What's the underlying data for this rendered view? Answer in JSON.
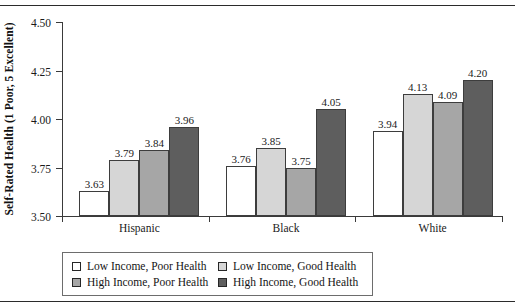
{
  "chart_data": {
    "type": "bar",
    "title": "",
    "xlabel": "",
    "ylabel": "Self-Rated Health (1 Poor, 5 Excellent)",
    "ylim": [
      3.5,
      4.5
    ],
    "yticks": [
      "3.50",
      "3.75",
      "4.00",
      "4.25",
      "4.50"
    ],
    "ytick_values": [
      3.5,
      3.75,
      4.0,
      4.25,
      4.5
    ],
    "grid": false,
    "legend_position": "bottom-left",
    "categories": [
      "Hispanic",
      "Black",
      "White"
    ],
    "series": [
      {
        "name": "Low Income, Poor Health",
        "color": "#ffffff",
        "swatch": "sw-white",
        "values": [
          3.63,
          3.76,
          3.94
        ],
        "labels": [
          "3.63",
          "3.76",
          "3.94"
        ]
      },
      {
        "name": "Low Income, Good Health",
        "color": "#d6d6d6",
        "swatch": "sw-light",
        "values": [
          3.79,
          3.85,
          4.13
        ],
        "labels": [
          "3.79",
          "3.85",
          "4.13"
        ]
      },
      {
        "name": "High Income, Poor Health",
        "color": "#a6a6a6",
        "swatch": "sw-med",
        "values": [
          3.84,
          3.75,
          4.09
        ],
        "labels": [
          "3.84",
          "3.75",
          "4.09"
        ]
      },
      {
        "name": "High Income, Good Health",
        "color": "#5e5e5e",
        "swatch": "sw-dark",
        "values": [
          3.96,
          4.05,
          4.2
        ],
        "labels": [
          "3.96",
          "4.05",
          "4.20"
        ]
      }
    ]
  },
  "legend": {
    "entries": [
      {
        "label": "Low Income, Poor Health",
        "swatch": "sw-white"
      },
      {
        "label": "Low Income, Good Health",
        "swatch": "sw-light"
      },
      {
        "label": "High Income, Poor Health",
        "swatch": "sw-med"
      },
      {
        "label": "High Income, Good Health",
        "swatch": "sw-dark"
      }
    ]
  },
  "colors": {
    "low_income_poor": "#ffffff",
    "low_income_good": "#d6d6d6",
    "high_income_poor": "#a6a6a6",
    "high_income_good": "#5e5e5e",
    "axis": "#3a3a3a",
    "rule": "#2b2b2b"
  }
}
